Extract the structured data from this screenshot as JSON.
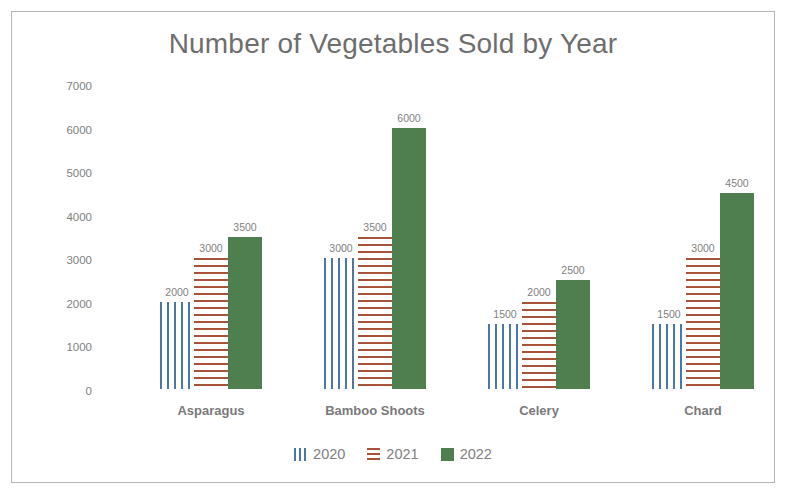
{
  "chart_data": {
    "type": "bar",
    "title": "Number of Vegetables Sold by Year",
    "xlabel": "",
    "ylabel": "",
    "ylim": [
      0,
      7000
    ],
    "ytick_values": [
      7000,
      6000,
      5000,
      4000,
      3000,
      2000,
      1000,
      0
    ],
    "ytick_labels": [
      "7000",
      "6000",
      "5000",
      "4000",
      "3000",
      "2000",
      "1000",
      "0"
    ],
    "grid": false,
    "legend_position": "bottom",
    "data_labels": true,
    "categories": [
      "Asparagus",
      "Bamboo Shoots",
      "Celery",
      "Chard"
    ],
    "series": [
      {
        "name": "2020",
        "values": [
          2000,
          3000,
          1500,
          1500
        ],
        "labels": [
          "2000",
          "3000",
          "1500",
          "1500"
        ],
        "color": "#4a76a8",
        "pattern": "vertical-stripes"
      },
      {
        "name": "2021",
        "values": [
          3000,
          3500,
          2000,
          3000
        ],
        "labels": [
          "3000",
          "3500",
          "2000",
          "3000"
        ],
        "color": "#a8523a",
        "pattern": "horizontal-stripes"
      },
      {
        "name": "2022",
        "values": [
          3500,
          6000,
          2500,
          4500
        ],
        "labels": [
          "3500",
          "6000",
          "2500",
          "4500"
        ],
        "color": "#4f7f4f",
        "pattern": "solid"
      }
    ]
  },
  "style": {
    "title_color": "#6e6e6e",
    "tick_color": "#808080",
    "category_color": "#7a7a7a",
    "border_color": "#b4b4b4",
    "plot_background": "#ffffff"
  }
}
